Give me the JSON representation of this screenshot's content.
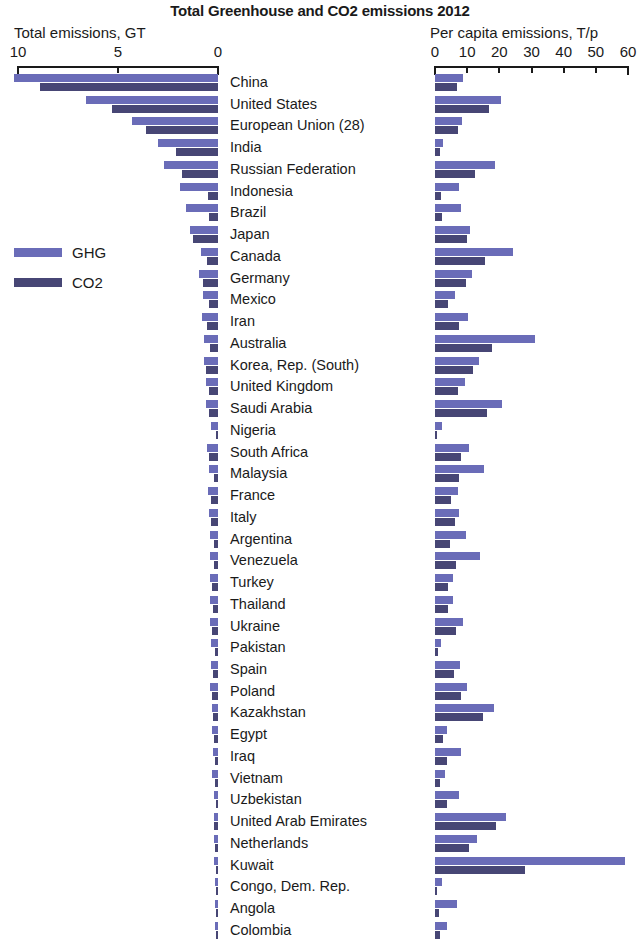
{
  "title": "Total Greenhouse and CO2 emissions 2012",
  "left_axis": {
    "caption": "Total emissions, GT",
    "ticks": [
      "10",
      "5",
      "0"
    ],
    "min": 0,
    "max": 10
  },
  "right_axis": {
    "caption": "Per capita emissions, T/p",
    "ticks": [
      "0",
      "10",
      "20",
      "30",
      "40",
      "50",
      "60"
    ],
    "min": 0,
    "max": 60
  },
  "legend": {
    "items": [
      {
        "label": "GHG",
        "color": "#6a6cb8"
      },
      {
        "label": "CO2",
        "color": "#474675"
      }
    ]
  },
  "chart_data": {
    "type": "bar",
    "title": "Total Greenhouse and CO2 emissions 2012",
    "orientation": "horizontal",
    "panels": [
      {
        "name": "total",
        "xlabel": "Total emissions, GT",
        "xlim": [
          10,
          0
        ],
        "direction": "reversed",
        "unit": "GT"
      },
      {
        "name": "per_capita",
        "xlabel": "Per capita emissions, T/p",
        "xlim": [
          0,
          60
        ],
        "direction": "normal",
        "unit": "T/p"
      }
    ],
    "series": [
      "GHG",
      "CO2"
    ],
    "grid": false,
    "legend_position": "left-middle",
    "categories": [
      "China",
      "United States",
      "European Union (28)",
      "India",
      "Russian Federation",
      "Indonesia",
      "Brazil",
      "Japan",
      "Canada",
      "Germany",
      "Mexico",
      "Iran",
      "Australia",
      "Korea, Rep. (South)",
      "United Kingdom",
      "Saudi Arabia",
      "Nigeria",
      "South Africa",
      "Malaysia",
      "France",
      "Italy",
      "Argentina",
      "Venezuela",
      "Turkey",
      "Thailand",
      "Ukraine",
      "Pakistan",
      "Spain",
      "Poland",
      "Kazakhstan",
      "Egypt",
      "Iraq",
      "Vietnam",
      "Uzbekistan",
      "United Arab Emirates",
      "Netherlands",
      "Kuwait",
      "Congo, Dem. Rep.",
      "Angola",
      "Colombia"
    ],
    "total_ghg_gt": [
      10.2,
      6.6,
      4.3,
      3.0,
      2.7,
      1.9,
      1.6,
      1.4,
      0.85,
      0.93,
      0.75,
      0.78,
      0.71,
      0.69,
      0.6,
      0.62,
      0.35,
      0.55,
      0.45,
      0.48,
      0.46,
      0.4,
      0.42,
      0.41,
      0.38,
      0.39,
      0.36,
      0.36,
      0.38,
      0.31,
      0.3,
      0.27,
      0.28,
      0.22,
      0.21,
      0.22,
      0.21,
      0.15,
      0.14,
      0.17
    ],
    "total_co2_gt": [
      8.9,
      5.3,
      3.6,
      2.1,
      1.8,
      0.5,
      0.44,
      1.25,
      0.54,
      0.77,
      0.47,
      0.57,
      0.39,
      0.59,
      0.46,
      0.46,
      0.08,
      0.43,
      0.22,
      0.33,
      0.37,
      0.19,
      0.19,
      0.3,
      0.26,
      0.3,
      0.16,
      0.27,
      0.31,
      0.25,
      0.21,
      0.13,
      0.14,
      0.11,
      0.18,
      0.17,
      0.1,
      0.01,
      0.03,
      0.07
    ],
    "per_capita_ghg_tp": [
      8.8,
      20.5,
      8.5,
      2.4,
      18.8,
      7.6,
      8.1,
      11.0,
      24.3,
      11.4,
      6.2,
      10.2,
      31.0,
      13.8,
      9.4,
      20.8,
      2.1,
      10.5,
      15.2,
      7.3,
      7.6,
      9.6,
      14.0,
      5.5,
      5.6,
      8.6,
      2.0,
      7.7,
      9.9,
      18.2,
      3.7,
      8.0,
      3.1,
      7.5,
      22.0,
      13.0,
      59.0,
      2.2,
      6.8,
      3.6
    ],
    "per_capita_co2_tp": [
      6.7,
      16.9,
      7.1,
      1.7,
      12.5,
      2.0,
      2.2,
      9.8,
      15.5,
      9.5,
      3.9,
      7.5,
      17.8,
      11.8,
      7.2,
      16.3,
      0.5,
      8.1,
      7.4,
      5.0,
      6.1,
      4.6,
      6.4,
      4.1,
      3.9,
      6.6,
      0.9,
      5.8,
      8.1,
      15.0,
      2.6,
      3.8,
      1.6,
      3.7,
      19.0,
      10.5,
      28.0,
      0.1,
      1.3,
      1.6
    ]
  }
}
